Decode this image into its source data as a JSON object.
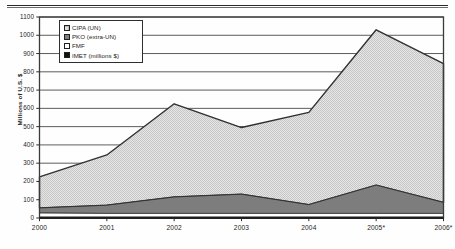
{
  "figure": {
    "rule_top": "horizontal-rule",
    "background": "#fefefe"
  },
  "axis": {
    "ylabel": "Millions of U.S. $",
    "yticks": [
      "1100",
      "1000",
      "900",
      "800",
      "700",
      "600",
      "500",
      "400",
      "300",
      "200",
      "100",
      "0"
    ],
    "xticks": [
      "2000",
      "2001",
      "2002",
      "2003",
      "2004",
      "2005*",
      "2006*"
    ]
  },
  "legend": {
    "items": [
      {
        "label": "CIPA (UN)",
        "swatch": "light-dotted",
        "color": "#e2e2e2"
      },
      {
        "label": "PKO (extra-UN)",
        "swatch": "gray-filled",
        "color": "#808080"
      },
      {
        "label": "FMF",
        "swatch": "white-filled",
        "color": "#ffffff"
      },
      {
        "label": "IMET (millions $)",
        "swatch": "black-filled",
        "color": "#121212"
      }
    ]
  },
  "chart_data": {
    "type": "area",
    "stacked": true,
    "title": "",
    "xlabel": "",
    "ylabel": "Millions of U.S. $",
    "categories": [
      "2000",
      "2001",
      "2002",
      "2003",
      "2004",
      "2005*",
      "2006*"
    ],
    "ylim": [
      0,
      1100
    ],
    "ytick_step": 100,
    "grid": true,
    "legend_position": "top-left",
    "stack_order_bottom_up": [
      "IMET (millions $)",
      "FMF",
      "PKO (extra-UN)",
      "CIPA (UN)"
    ],
    "series": [
      {
        "name": "IMET (millions $)",
        "color": "#121212",
        "values": [
          5,
          5,
          5,
          5,
          5,
          5,
          5
        ]
      },
      {
        "name": "FMF",
        "color": "#ffffff",
        "values": [
          22,
          20,
          20,
          20,
          20,
          20,
          20
        ]
      },
      {
        "name": "PKO (extra-UN)",
        "color": "#808080",
        "values": [
          28,
          45,
          90,
          105,
          48,
          155,
          60
        ]
      },
      {
        "name": "CIPA (UN)",
        "color": "#e2e2e2",
        "values": [
          170,
          275,
          510,
          365,
          505,
          850,
          760
        ]
      }
    ],
    "totals": [
      225,
      345,
      625,
      495,
      578,
      1030,
      845
    ],
    "cumulative_tops": {
      "imet": [
        5,
        5,
        5,
        5,
        5,
        5,
        5
      ],
      "fmf": [
        27,
        25,
        25,
        25,
        25,
        25,
        25
      ],
      "pko": [
        55,
        70,
        115,
        130,
        73,
        180,
        85
      ],
      "cipa": [
        225,
        345,
        625,
        495,
        578,
        1030,
        845
      ]
    }
  }
}
